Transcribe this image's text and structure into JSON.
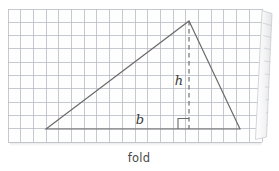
{
  "figure": {
    "caption": "fold",
    "labels": {
      "height": "h",
      "base": "b"
    },
    "colors": {
      "background": "#ffffff",
      "paper": "#fefefe",
      "grid_line": "#b9bcc4",
      "paper_edge": "#c9ccd2",
      "shape_line": "#6b6b6b",
      "dashed_line": "#6b6b6b",
      "text": "#4a4a4a",
      "shadow": "#d8d8d8"
    },
    "grid": {
      "left": 8,
      "top": 9,
      "right": 262,
      "bottom": 142,
      "cell_size": 12.7,
      "columns": 20,
      "rows": 10
    },
    "triangle": {
      "vertices": [
        {
          "name": "left-base-vertex",
          "x": 46,
          "y": 129
        },
        {
          "name": "apex",
          "x": 189,
          "y": 21
        },
        {
          "name": "right-base-vertex",
          "x": 240,
          "y": 129
        }
      ]
    },
    "height_segment": {
      "from": {
        "x": 189,
        "y": 21
      },
      "to": {
        "x": 189,
        "y": 129
      },
      "style": "dashed"
    },
    "right_angle_marker": {
      "x": 189,
      "y": 129,
      "size": 11,
      "side": "left"
    },
    "label_positions": {
      "height": {
        "x": 179,
        "y": 85
      },
      "base": {
        "x": 140,
        "y": 124
      },
      "caption": {
        "x": 139,
        "y": 162
      }
    },
    "page_curl": {
      "present": true,
      "side": "right",
      "top": {
        "x": 262,
        "y": 11
      },
      "bottom": {
        "x": 255,
        "y": 139
      }
    }
  }
}
